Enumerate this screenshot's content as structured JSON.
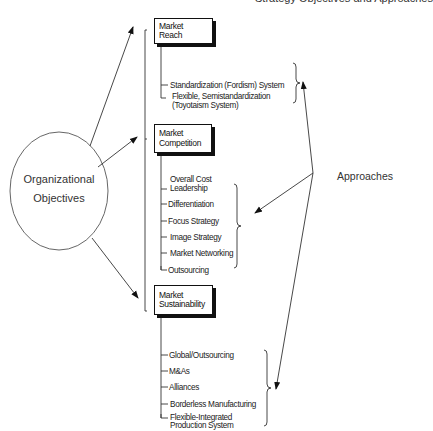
{
  "header": {
    "title_partial": "Strategy Objectives and Approaches"
  },
  "center": {
    "label_line1": "Organizational",
    "label_line2": "Objectives"
  },
  "approaches_label": "Approaches",
  "objectives": [
    {
      "label": "Market Reach",
      "items": [
        "Standardization (Fordism) System",
        "Flexible, Semistandardization",
        "(Toyotaism System)"
      ]
    },
    {
      "label_line1": "Market",
      "label_line2": "Competition",
      "items": [
        "Overall Cost",
        "Leadership",
        "Differentiation",
        "Focus Strategy",
        "Image Strategy",
        "Market Networking",
        "Outsourcing"
      ]
    },
    {
      "label_line1": "Market",
      "label_line2": "Sustainability",
      "items": [
        "Global/Outsourcing",
        "M&As",
        "Alliances",
        "Borderless Manufacturing",
        "Flexible-Integrated",
        "Production System"
      ]
    }
  ]
}
